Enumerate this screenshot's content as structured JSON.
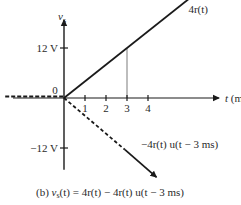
{
  "chart_data": {
    "type": "line",
    "ylabel": "v_s",
    "xlabel": "t (ms)",
    "x_ticks": [
      "1",
      "2",
      "3",
      "4"
    ],
    "y_ticks": [
      {
        "value": 12,
        "label": "12 V"
      },
      {
        "value": -12,
        "label": "−12 V"
      }
    ],
    "origin_label": "0",
    "xlim": [
      -3,
      7
    ],
    "ylim": [
      -17,
      18
    ],
    "series": [
      {
        "name": "4r(t)",
        "style": "solid-arrow",
        "points": [
          [
            0,
            0
          ],
          [
            6.4,
            25.6
          ]
        ],
        "label": "4r(t)"
      },
      {
        "name": "-4r(t) u(t-3 ms)",
        "style": "dashed-then-solid-arrow",
        "points": [
          [
            0,
            0
          ],
          [
            2.9,
            -12.4
          ],
          [
            4.4,
            -19
          ]
        ],
        "label": "−4r(t) u(t − 3 ms)"
      },
      {
        "name": "v_s(t) for t<0",
        "style": "dashed",
        "points": [
          [
            -2.8,
            0
          ],
          [
            0,
            0
          ]
        ]
      },
      {
        "name": "hold line at t=3",
        "style": "gray-vertical",
        "points": [
          [
            3,
            0
          ],
          [
            3,
            12
          ]
        ]
      }
    ],
    "caption": {
      "prefix": "(b) ",
      "lhs_sym": "v",
      "lhs_sub": "s",
      "rhs": "(t) = 4r(t) − 4r(t) u(t − 3 ms)"
    }
  }
}
